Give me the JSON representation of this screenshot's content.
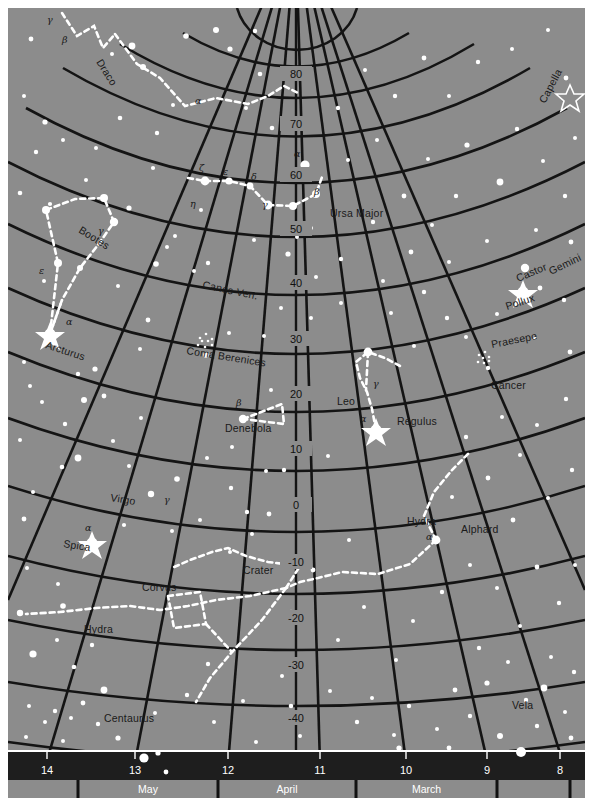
{
  "chart": {
    "type": "sky-map",
    "background_color": "#8c8c8c",
    "grid_color": "#111111",
    "star_color": "#ffffff",
    "constellation_line_color": "#ffffff",
    "bar_color": "#1e1e1e",
    "page_background": "#ffffff"
  },
  "declination_scale": {
    "axis_name": "declination",
    "unit": "degrees",
    "labels": [
      "80",
      "70",
      "60",
      "50",
      "40",
      "30",
      "20",
      "10",
      "0",
      "-10",
      "-20",
      "-30",
      "-40"
    ],
    "values": [
      80,
      70,
      60,
      50,
      40,
      30,
      20,
      10,
      0,
      -10,
      -20,
      -30,
      -40
    ],
    "positions_y": [
      74,
      124,
      175,
      229,
      283,
      339,
      394,
      449,
      505,
      562,
      618,
      665,
      718
    ]
  },
  "right_ascension_scale": {
    "axis_name": "right ascension",
    "unit": "hours",
    "labels": [
      "14",
      "13",
      "12",
      "11",
      "10",
      "9",
      "8"
    ],
    "values": [
      14,
      13,
      12,
      11,
      10,
      9,
      8
    ],
    "positions_x": [
      47,
      135,
      228,
      320,
      406,
      487,
      560
    ]
  },
  "month_scale": {
    "labels": [
      "May",
      "April",
      "March"
    ],
    "segments": [
      {
        "label": "May",
        "x_start": 78,
        "x_end": 218
      },
      {
        "label": "April",
        "x_start": 218,
        "x_end": 356
      },
      {
        "label": "March",
        "x_start": 356,
        "x_end": 497
      }
    ]
  },
  "constellations": [
    {
      "name": "Draco",
      "x": 96,
      "y": 62,
      "rotation": 58
    },
    {
      "name": "Ursa Major",
      "x": 330,
      "y": 217,
      "rotation": 0
    },
    {
      "name": "Bootes",
      "x": 78,
      "y": 232,
      "rotation": 32
    },
    {
      "name": "Canes Ven.",
      "x": 202,
      "y": 288,
      "rotation": 12
    },
    {
      "name": "Coma Berenices",
      "x": 186,
      "y": 354,
      "rotation": 9
    },
    {
      "name": "Leo",
      "x": 337,
      "y": 405,
      "rotation": 0
    },
    {
      "name": "Cancer",
      "x": 491,
      "y": 389,
      "rotation": 0
    },
    {
      "name": "Gemini",
      "x": 551,
      "y": 275,
      "rotation": -26
    },
    {
      "name": "Virgo",
      "x": 110,
      "y": 501,
      "rotation": 9
    },
    {
      "name": "Corvus",
      "x": 142,
      "y": 591,
      "rotation": 0
    },
    {
      "name": "Crater",
      "x": 243,
      "y": 574,
      "rotation": 0
    },
    {
      "name": "Hydra",
      "x": 407,
      "y": 525,
      "rotation": 0
    },
    {
      "name": "Hydra",
      "x": 84,
      "y": 633,
      "rotation": 0
    },
    {
      "name": "Centaurus",
      "x": 104,
      "y": 722,
      "rotation": 0
    },
    {
      "name": "Vela",
      "x": 512,
      "y": 709,
      "rotation": 0
    }
  ],
  "named_stars": [
    {
      "name": "Capella",
      "x": 545,
      "y": 104,
      "rotation": -62,
      "star_x": 570,
      "star_y": 96,
      "symbol": "outline-star"
    },
    {
      "name": "Castor",
      "x": 518,
      "y": 282,
      "rotation": -23,
      "star_x": 525,
      "star_y": 268,
      "symbol": "dot"
    },
    {
      "name": "Pollux",
      "x": 507,
      "y": 310,
      "rotation": -18,
      "star_x": 523,
      "star_y": 292,
      "symbol": "bright-star"
    },
    {
      "name": "Praesepe",
      "x": 492,
      "y": 348,
      "rotation": -11,
      "star_x": 483,
      "star_y": 358,
      "symbol": "cluster"
    },
    {
      "name": "Regulus",
      "x": 397,
      "y": 425,
      "rotation": 0,
      "star_x": 376,
      "star_y": 430,
      "symbol": "bright-star"
    },
    {
      "name": "Denebola",
      "x": 225,
      "y": 432,
      "rotation": 0,
      "star_x": 243,
      "star_y": 419,
      "symbol": "dot"
    },
    {
      "name": "Alphard",
      "x": 461,
      "y": 533,
      "rotation": 0,
      "star_x": 436,
      "star_y": 540,
      "symbol": "dot"
    },
    {
      "name": "Arcturus",
      "x": 45,
      "y": 348,
      "rotation": 18,
      "star_x": 50,
      "star_y": 334,
      "symbol": "bright-star"
    },
    {
      "name": "Spica",
      "x": 63,
      "y": 547,
      "rotation": 9,
      "star_x": 92,
      "star_y": 543,
      "symbol": "bright-star"
    }
  ],
  "greek_labels": [
    {
      "letter": "β",
      "x": 62,
      "y": 43
    },
    {
      "letter": "γ",
      "x": 47,
      "y": 23
    },
    {
      "letter": "α",
      "x": 195,
      "y": 104
    },
    {
      "letter": "ζ",
      "x": 199,
      "y": 171
    },
    {
      "letter": "ε",
      "x": 223,
      "y": 175
    },
    {
      "letter": "δ",
      "x": 251,
      "y": 180
    },
    {
      "letter": "η",
      "x": 190,
      "y": 207
    },
    {
      "letter": "γ",
      "x": 262,
      "y": 208
    },
    {
      "letter": "α",
      "x": 294,
      "y": 157
    },
    {
      "letter": "β",
      "x": 314,
      "y": 195
    },
    {
      "letter": "γ",
      "x": 98,
      "y": 234
    },
    {
      "letter": "ε",
      "x": 39,
      "y": 274
    },
    {
      "letter": "α",
      "x": 66,
      "y": 325
    },
    {
      "letter": "β",
      "x": 236,
      "y": 406
    },
    {
      "letter": "γ",
      "x": 373,
      "y": 387
    },
    {
      "letter": "α",
      "x": 360,
      "y": 422
    },
    {
      "letter": "α",
      "x": 85,
      "y": 531
    },
    {
      "letter": "γ",
      "x": 164,
      "y": 503
    },
    {
      "letter": "α",
      "x": 426,
      "y": 540
    }
  ],
  "grid": {
    "declination_circles": 13,
    "ra_meridians": 8,
    "note": "polar stereographic sky map"
  }
}
